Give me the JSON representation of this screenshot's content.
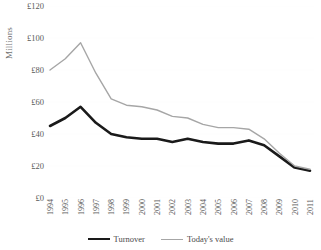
{
  "chart_data": {
    "type": "line",
    "title": "",
    "xlabel": "",
    "ylabel": "Millions",
    "ylim": [
      0,
      120
    ],
    "ytick_step": 20,
    "ytick_labels": [
      "£120",
      "£100",
      "£80",
      "£60",
      "£40",
      "£20",
      "£0"
    ],
    "ytick_values": [
      120,
      100,
      80,
      60,
      40,
      20,
      0
    ],
    "grid": false,
    "legend_position": "bottom",
    "categories": [
      "1994",
      "1995",
      "1996",
      "1997",
      "1998",
      "1999",
      "2000",
      "2001",
      "2002",
      "2003",
      "2004",
      "2005",
      "2006",
      "2007",
      "2008",
      "2009",
      "2010",
      "2011"
    ],
    "series": [
      {
        "name": "Turnover",
        "color": "#1a1a1a",
        "width": 2.6,
        "values": [
          45,
          50,
          57,
          47,
          40,
          38,
          37,
          37,
          35,
          37,
          35,
          34,
          34,
          36,
          33,
          26,
          19,
          17
        ]
      },
      {
        "name": "Today's value",
        "color": "#a6a6a6",
        "width": 1.4,
        "values": [
          80,
          87,
          97,
          78,
          62,
          58,
          57,
          55,
          51,
          50,
          46,
          44,
          44,
          43,
          37,
          28,
          20,
          18
        ]
      }
    ]
  },
  "legend": {
    "items": [
      {
        "label": "Turnover"
      },
      {
        "label": "Today's value"
      }
    ]
  },
  "axis": {
    "y_title": "Millions"
  }
}
